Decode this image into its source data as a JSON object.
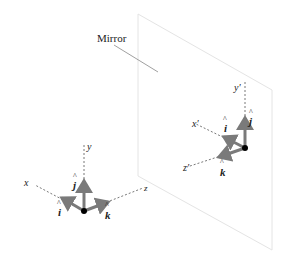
{
  "diagram": {
    "mirror_label": "Mirror",
    "left_frame": {
      "axes": {
        "x": "x",
        "y": "y",
        "z": "z"
      },
      "unit_vectors": {
        "i": "i",
        "j": "j",
        "k": "k"
      },
      "hat": "^"
    },
    "right_frame": {
      "axes": {
        "x": "x′",
        "y": "y′",
        "z": "z′"
      },
      "unit_vectors": {
        "i": "i",
        "j": "j",
        "k": "k"
      },
      "hat": "^"
    },
    "colors": {
      "arrow": "#7a7a7a",
      "axis": "#555555",
      "mirror_edge": "#e6e6e6",
      "dot": "#000000",
      "text": "#222222"
    }
  }
}
